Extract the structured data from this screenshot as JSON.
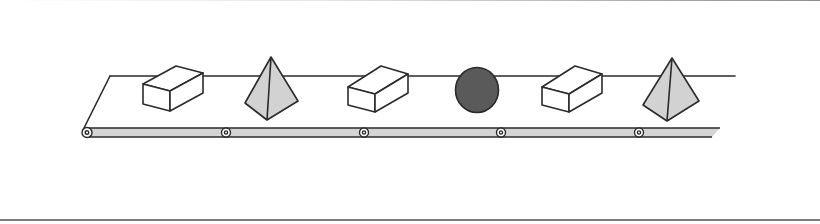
{
  "diagram": {
    "type": "conveyor-belt-illustration",
    "colors": {
      "stroke": "#2b2b2b",
      "belt_fill": "#d4d4d4",
      "pyramid_fill": "#d2d2d2",
      "sphere_fill": "#5a5a5a",
      "box_fill": "#ffffff",
      "background": "#ffffff"
    },
    "objects": [
      {
        "shape": "box",
        "position": 1
      },
      {
        "shape": "pyramid",
        "position": 2
      },
      {
        "shape": "box",
        "position": 3
      },
      {
        "shape": "sphere",
        "position": 4
      },
      {
        "shape": "box",
        "position": 5
      },
      {
        "shape": "pyramid",
        "position": 6
      }
    ],
    "roller_count": 5
  }
}
